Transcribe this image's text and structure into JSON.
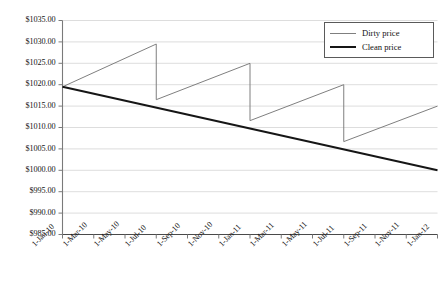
{
  "chart_data": {
    "type": "line",
    "title": "",
    "xlabel": "",
    "ylabel": "",
    "ylim": [
      985,
      1035
    ],
    "ytick_values": [
      985,
      990,
      995,
      1000,
      1005,
      1010,
      1015,
      1020,
      1025,
      1030,
      1035
    ],
    "ytick_labels": [
      "$985.00",
      "$990.00",
      "$995.00",
      "$1000.00",
      "$1005.00",
      "$1010.00",
      "$1015.00",
      "$1020.00",
      "$1025.00",
      "$1030.00",
      "$1035.00"
    ],
    "categories": [
      "1-Jan-10",
      "1-Mar-10",
      "1-May-10",
      "1-Jul-10",
      "1-Sep-10",
      "1-Nov-10",
      "1-Jan-11",
      "1-Mar-11",
      "1-May-11",
      "1-Jul-11",
      "1-Sep-11",
      "1-Nov-11",
      "1-Jan-12"
    ],
    "grid": "horizontal",
    "legend_position": "top-right",
    "series": [
      {
        "name": "Dirty price",
        "color": "#7f7f7f",
        "line_width": 1,
        "x": [
          0,
          6,
          6,
          12,
          12,
          18,
          18,
          24
        ],
        "x_labels": [
          "1-Jan-10",
          "1-Jul-10",
          "1-Jul-10",
          "1-Jan-11",
          "1-Jan-11",
          "1-Jul-11",
          "1-Jul-11",
          "1-Jan-12"
        ],
        "values": [
          1019.5,
          1029.5,
          1016.5,
          1025.0,
          1011.6,
          1020.0,
          1006.7,
          1015.0
        ]
      },
      {
        "name": "Clean price",
        "color": "#161616",
        "line_width": 2,
        "x": [
          0,
          24
        ],
        "x_labels": [
          "1-Jan-10",
          "1-Jan-12"
        ],
        "values": [
          1019.5,
          1000.0
        ]
      }
    ]
  },
  "legend": {
    "entries": [
      {
        "label": "Dirty price"
      },
      {
        "label": "Clean price"
      }
    ]
  }
}
